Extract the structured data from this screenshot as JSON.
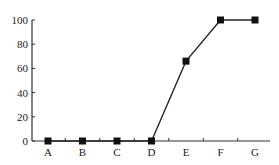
{
  "chart_data": {
    "type": "line",
    "title": "",
    "xlabel": "",
    "ylabel": "",
    "categories": [
      "A",
      "B",
      "C",
      "D",
      "E",
      "F",
      "G"
    ],
    "values": [
      0,
      0,
      0,
      0,
      66,
      100,
      100
    ],
    "ylim": [
      0,
      100
    ],
    "yticks": [
      0,
      20,
      40,
      60,
      80,
      100
    ],
    "grid": false,
    "legend": null,
    "marker": "square",
    "colors": {
      "line": "#222222",
      "marker": "#111111",
      "axis": "#333333"
    }
  }
}
